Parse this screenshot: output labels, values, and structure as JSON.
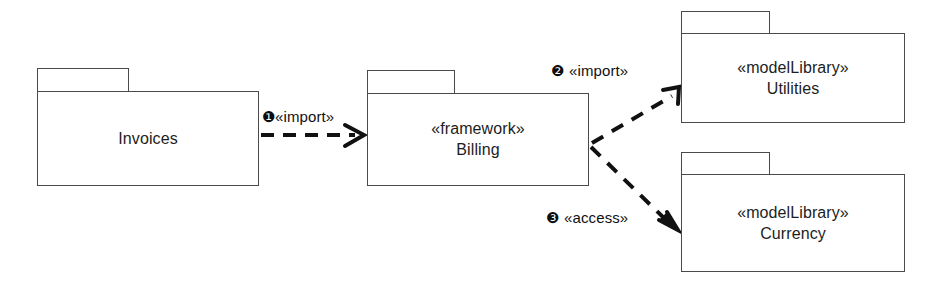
{
  "diagram": {
    "kind": "uml-package-diagram",
    "background_color": "#ffffff",
    "line_color": "#4a4a4a",
    "text_color": "#1d1d1d",
    "width": 944,
    "height": 286
  },
  "packages": [
    {
      "id": "invoices",
      "stereotype": "",
      "name": "Invoices"
    },
    {
      "id": "billing",
      "stereotype": "«framework»",
      "name": "Billing"
    },
    {
      "id": "utilities",
      "stereotype": "«modelLibrary»",
      "name": "Utilities"
    },
    {
      "id": "currency",
      "stereotype": "«modelLibrary»",
      "name": "Currency"
    }
  ],
  "dependencies": [
    {
      "id": "dep-1",
      "badge": "❶",
      "number": "1",
      "stereotype": "«import»",
      "source": "Invoices",
      "target": "Billing",
      "line_style": "dashed",
      "arrowhead": "open"
    },
    {
      "id": "dep-2",
      "badge": "❷",
      "number": "2",
      "stereotype": "«import»",
      "source": "Billing",
      "target": "Utilities",
      "line_style": "dashed",
      "arrowhead": "open"
    },
    {
      "id": "dep-3",
      "badge": "❸",
      "number": "3",
      "stereotype": "«access»",
      "source": "Billing",
      "target": "Currency",
      "line_style": "dashed",
      "arrowhead": "open"
    }
  ]
}
